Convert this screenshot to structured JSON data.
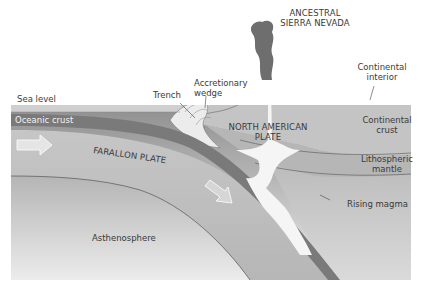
{
  "labels": {
    "ancestral_line1": "ANCESTRAL",
    "ancestral_line2": "SIERRA NEVADA",
    "continental_interior_line1": "Continental",
    "continental_interior_line2": "interior",
    "accretionary_line1": "Accretionary",
    "accretionary_line2": "wedge",
    "trench": "Trench",
    "sea_level": "Sea level",
    "oceanic_crust": "Oceanic crust",
    "north_american_line1": "NORTH AMERICAN",
    "north_american_line2": "PLATE",
    "continental_crust_line1": "Continental",
    "continental_crust_line2": "crust",
    "farallon_plate": "FARALLON PLATE",
    "lithospheric_line1": "Lithospheric",
    "lithospheric_line2": "mantle",
    "rising_magma": "Rising magma",
    "asthenosphere": "Asthenosphere"
  },
  "colors": {
    "background": "#ffffff",
    "ocean_water": "#c9c9c9",
    "oceanic_crust": "#7a7a7a",
    "farallon_plate": "#bdbdbd",
    "continental_crust": "#c4c4c4",
    "lithospheric_mantle": "#b9b9b9",
    "asthenosphere_top": "#9a9a9a",
    "asthenosphere_bottom": "#e6e6e6",
    "magma": "#f7f7f7",
    "volcanic_plume": "#6e6e6e",
    "text": "#3a3a3a"
  },
  "arrows": [
    {
      "name": "farallon-motion-arrow-left",
      "direction": "east"
    },
    {
      "name": "subduction-arrow",
      "direction": "southeast"
    }
  ]
}
